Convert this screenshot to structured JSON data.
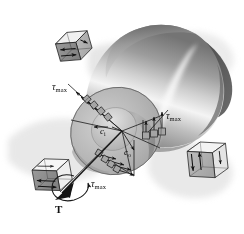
{
  "figure": {
    "background_color": "#ffffff",
    "width": 244,
    "height": 234
  },
  "labels": {
    "tau_max_upper_left": {
      "symbol": "τ",
      "subscript": "max"
    },
    "tau_max_right": {
      "symbol": "τ",
      "subscript": "max"
    },
    "tau_max_lower": {
      "symbol": "τ",
      "subscript": "max"
    },
    "inner_radius": {
      "symbol": "c",
      "subscript": "i"
    },
    "outer_radius": {
      "symbol": "c",
      "subscript": "o"
    },
    "torque": {
      "symbol": "T"
    }
  },
  "icons": {
    "torque_vector": "torque-arrow-icon",
    "rotation": "curved-rotation-arrow-icon",
    "stress_arrow": "shear-stress-arrow-icon"
  },
  "colors": {
    "shaft_light": "#f2f2f2",
    "shaft_mid": "#b8b8b8",
    "shaft_dark": "#6e6e6e",
    "shaft_end_dark": "#5a5a5a",
    "section_face": "#b4b4b4",
    "section_inner": "#c9c9c9",
    "cube_face_dark": "#8f8f8f",
    "cube_face_light": "#ebebeb",
    "outline": "#1a1a1a",
    "shadow": "#d6d6d6",
    "label_text": "#111111"
  },
  "elements": {
    "shaft": {
      "name": "hollow-circular-shaft",
      "shape": "cylinder"
    },
    "cross_section": {
      "name": "annular-cross-section",
      "shape": "ellipse-annulus"
    },
    "stress_elements": [
      {
        "name": "stress-cube-upper-left",
        "state": "pure-shear"
      },
      {
        "name": "stress-cube-right",
        "state": "pure-shear"
      },
      {
        "name": "stress-cube-lower-left",
        "state": "pure-shear"
      }
    ],
    "stress_distributions": [
      {
        "name": "stress-distribution-upper-left",
        "arrow_count": 4,
        "variation": "linear"
      },
      {
        "name": "stress-distribution-right",
        "arrow_count": 4,
        "variation": "linear"
      },
      {
        "name": "stress-distribution-lower-left",
        "arrow_count": 4,
        "variation": "linear"
      }
    ]
  }
}
